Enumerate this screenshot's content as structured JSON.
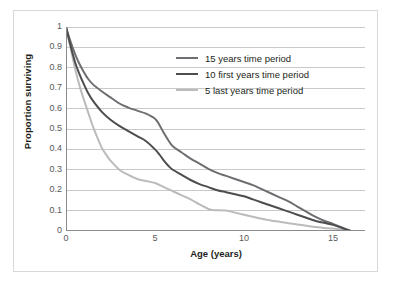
{
  "chart_data": {
    "type": "line",
    "title": "",
    "xlabel": "Age (years)",
    "ylabel": "Proportion surviving",
    "xlim": [
      0,
      16.8
    ],
    "ylim": [
      0,
      1
    ],
    "xticks": [
      0,
      5,
      10,
      15
    ],
    "xtick_labels": [
      "0",
      "5",
      "10",
      "15"
    ],
    "yticks": [
      0,
      0.1,
      0.2,
      0.3,
      0.4,
      0.5,
      0.6,
      0.7,
      0.8,
      0.9,
      1
    ],
    "ytick_labels": [
      "0",
      "0.1",
      "0.2",
      "0.3",
      "0.4",
      "0.5",
      "0.6",
      "0.7",
      "0.8",
      "0.9",
      "1"
    ],
    "grid": "horizontal",
    "legend_position": "upper-right-inside",
    "series": [
      {
        "name": "15 years time period",
        "color": "#6d6e71",
        "x": [
          0,
          0.25,
          0.5,
          0.75,
          1,
          1.25,
          1.5,
          2,
          2.5,
          3,
          3.5,
          4,
          4.5,
          5,
          5.25,
          5.5,
          5.75,
          6,
          6.5,
          7,
          7.5,
          8,
          8.5,
          9,
          9.5,
          10,
          10.5,
          11,
          11.5,
          12,
          12.5,
          13,
          13.5,
          14,
          14.5,
          15,
          15.5,
          16
        ],
        "y": [
          1,
          0.93,
          0.87,
          0.82,
          0.78,
          0.745,
          0.72,
          0.685,
          0.655,
          0.625,
          0.605,
          0.59,
          0.575,
          0.55,
          0.52,
          0.48,
          0.445,
          0.415,
          0.385,
          0.355,
          0.33,
          0.305,
          0.285,
          0.27,
          0.255,
          0.24,
          0.225,
          0.205,
          0.185,
          0.165,
          0.145,
          0.12,
          0.095,
          0.07,
          0.05,
          0.035,
          0.018,
          0
        ]
      },
      {
        "name": "10 first years time period",
        "color": "#4d4d4f",
        "x": [
          0,
          0.25,
          0.5,
          0.75,
          1,
          1.25,
          1.5,
          2,
          2.5,
          3,
          3.5,
          4,
          4.5,
          5,
          5.25,
          5.5,
          5.75,
          6,
          6.5,
          7,
          7.5,
          8,
          8.5,
          9,
          9.5,
          10,
          10.5,
          11,
          11.5,
          12,
          12.5,
          13,
          13.5,
          14,
          14.5,
          15,
          15.5,
          16
        ],
        "y": [
          1,
          0.91,
          0.83,
          0.77,
          0.72,
          0.675,
          0.64,
          0.585,
          0.545,
          0.515,
          0.49,
          0.465,
          0.44,
          0.4,
          0.375,
          0.345,
          0.32,
          0.3,
          0.275,
          0.25,
          0.23,
          0.215,
          0.2,
          0.19,
          0.18,
          0.17,
          0.155,
          0.14,
          0.125,
          0.11,
          0.095,
          0.08,
          0.065,
          0.05,
          0.04,
          0.03,
          0.015,
          0
        ]
      },
      {
        "name": "5 last years time period",
        "color": "#b9bbbd",
        "x": [
          0,
          0.25,
          0.5,
          0.75,
          1,
          1.25,
          1.5,
          1.75,
          2,
          2.25,
          2.5,
          3,
          3.5,
          4,
          4.5,
          5,
          5.5,
          6,
          6.5,
          7,
          7.5,
          8,
          8.25,
          8.5,
          9,
          9.5,
          10,
          10.5,
          11,
          11.5,
          12,
          12.5,
          13,
          13.5,
          14,
          14.5,
          15,
          15.5,
          16
        ],
        "y": [
          1,
          0.9,
          0.8,
          0.715,
          0.645,
          0.58,
          0.515,
          0.46,
          0.41,
          0.375,
          0.345,
          0.3,
          0.275,
          0.255,
          0.245,
          0.235,
          0.215,
          0.195,
          0.175,
          0.155,
          0.13,
          0.108,
          0.103,
          0.102,
          0.1,
          0.09,
          0.08,
          0.07,
          0.06,
          0.052,
          0.045,
          0.038,
          0.032,
          0.026,
          0.02,
          0.015,
          0.012,
          0.006,
          0
        ]
      }
    ]
  },
  "legend": {
    "items": [
      {
        "label": "15 years time period",
        "color": "#6d6e71"
      },
      {
        "label": "10 first years time period",
        "color": "#4d4d4f"
      },
      {
        "label": "5 last years time period",
        "color": "#b9bbbd"
      }
    ]
  },
  "style": {
    "grid_color": "#c9c9c9",
    "axis_color": "#8b8b8b",
    "frame_color": "#d8d8d8",
    "tick_label_color": "#58595b",
    "axis_title_color": "#231f20",
    "background": "#ffffff"
  }
}
